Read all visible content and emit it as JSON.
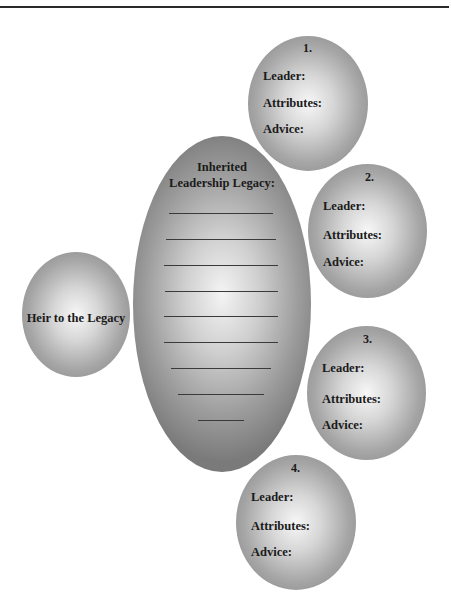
{
  "heir": {
    "label": "Heir to the Legacy"
  },
  "legacy": {
    "title_line1": "Inherited",
    "title_line2": "Leadership Legacy:",
    "blank_line_count": 9
  },
  "leaders": [
    {
      "number": "1.",
      "leader_label": "Leader:",
      "attributes_label": "Attributes:",
      "advice_label": "Advice:"
    },
    {
      "number": "2.",
      "leader_label": "Leader:",
      "attributes_label": "Attributes:",
      "advice_label": "Advice:"
    },
    {
      "number": "3.",
      "leader_label": "Leader:",
      "attributes_label": "Attributes:",
      "advice_label": "Advice:"
    },
    {
      "number": "4.",
      "leader_label": "Leader:",
      "attributes_label": "Attributes:",
      "advice_label": "Advice:"
    }
  ],
  "colors": {
    "shape_center": "#f7f7f7",
    "shape_edge": "#7d7d7d",
    "text": "#1a1a1a",
    "rule": "#2a2a2a"
  }
}
